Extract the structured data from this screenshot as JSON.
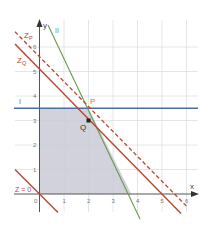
{
  "diagram": {
    "type": "linear-programming-graph",
    "axes": {
      "x_label": "x",
      "y_label": "y",
      "x_ticks": [
        "0",
        "1",
        "2",
        "3",
        "4",
        "5",
        "6"
      ],
      "y_ticks": [
        "1",
        "2",
        "3",
        "4",
        "5",
        "6"
      ]
    },
    "lines": [
      {
        "id": "I",
        "label": "I",
        "equation": "y = 3.5",
        "color": "#4a6f9c",
        "style": "solid"
      },
      {
        "id": "II",
        "label": "II",
        "equation": "2x + y = 7.5",
        "color": "#6a9a4a",
        "style": "solid"
      },
      {
        "id": "Z0",
        "label": "Z = 0",
        "equation": "x + y = 0",
        "color": "#b8472f",
        "style": "solid"
      },
      {
        "id": "ZQ",
        "label": "Z_Q",
        "label_main": "Z",
        "label_sub": "Q",
        "equation": "x + y = 5",
        "color": "#b8472f",
        "style": "solid"
      },
      {
        "id": "ZP",
        "label": "Z_P",
        "label_main": "Z",
        "label_sub": "P",
        "equation": "x + y = 5.5",
        "color": "#b8472f",
        "style": "dashed"
      }
    ],
    "points": [
      {
        "label": "P",
        "x": 2,
        "y": 3.5,
        "color": "#d9704a"
      },
      {
        "label": "Q",
        "x": 2,
        "y": 3,
        "color": "#333333"
      }
    ],
    "feasible_region": {
      "vertices": [
        [
          0,
          0
        ],
        [
          0,
          3.5
        ],
        [
          2,
          3.5
        ],
        [
          3.75,
          0
        ]
      ],
      "fill": "#c9cad6"
    }
  }
}
